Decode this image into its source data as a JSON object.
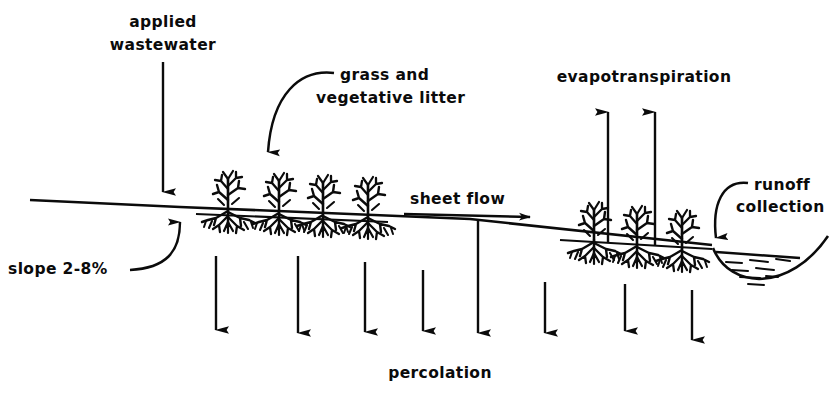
{
  "figure": {
    "background_color": "#ffffff",
    "ink_color": "#0b0b0b",
    "width": 839,
    "height": 401
  },
  "labels": {
    "applied_wastewater_line1": "applied",
    "applied_wastewater_line2": "wastewater",
    "grass_litter_line1": "grass  and",
    "grass_litter_line2": "vegetative  litter",
    "evapotranspiration": "evapotranspiration",
    "runoff_line1": "runoff",
    "runoff_line2": "collection",
    "sheet_flow": "sheet  flow",
    "slope": "slope 2-8%",
    "percolation": "percolation"
  },
  "diagram_data": {
    "type": "schematic-cross-section",
    "ground_slope_percent_range": "2-8%",
    "processes": [
      {
        "name": "applied wastewater",
        "direction": "down",
        "arrow_count": 1,
        "location": "upslope-top"
      },
      {
        "name": "sheet flow",
        "direction": "right",
        "arrow_count": 1,
        "location": "above-ground-surface"
      },
      {
        "name": "evapotranspiration",
        "direction": "up",
        "arrow_count": 2,
        "location": "downslope"
      },
      {
        "name": "percolation",
        "direction": "down",
        "arrow_count": 8,
        "location": "subsurface"
      },
      {
        "name": "runoff collection",
        "direction": "into-ditch",
        "arrow_count": 1,
        "location": "toe-of-slope"
      }
    ],
    "vegetation": {
      "label": "grass and vegetative litter",
      "upslope_plant_count": 4,
      "downslope_plant_count": 3,
      "roots_shown": true
    },
    "collection_ditch": {
      "label": "runoff collection",
      "water_shown": true
    }
  }
}
